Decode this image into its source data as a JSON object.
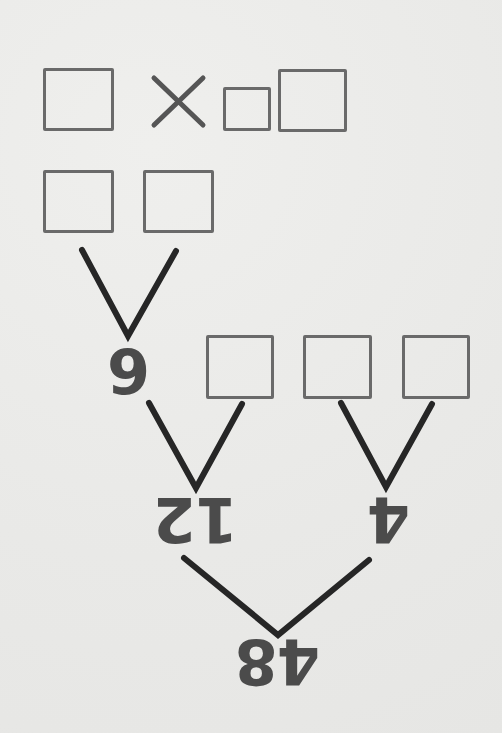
{
  "diagram": {
    "type": "factor-tree",
    "orientation": "rotated-180",
    "root": "48",
    "level1": {
      "left": "12",
      "right": "4"
    },
    "level2": {
      "left_known": "6"
    },
    "operator_symbol": "×",
    "blank_boxes": {
      "row_top": [
        "box",
        "×",
        "small-box",
        "box"
      ],
      "row_second": [
        "box",
        "box"
      ],
      "row_third": [
        "box",
        "box",
        "box"
      ]
    },
    "colors": {
      "background": "#ececea",
      "line": "#222222",
      "box_border": "#6a6a6a",
      "number": "#4b4b4b"
    }
  },
  "labels": {
    "root_number": "48",
    "left_child": "12",
    "right_child": "4",
    "grandchild": "6",
    "times": "×"
  }
}
